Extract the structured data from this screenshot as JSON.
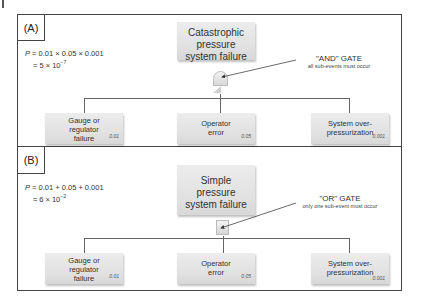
{
  "panels": [
    {
      "label": "(A)",
      "formula": {
        "p": "P",
        "line1": " = 0.01 × 0.05 × 0.001",
        "line2_prefix": "= 5 × 10",
        "line2_exp": "−7"
      },
      "top_event": {
        "line1": "Catastrophic",
        "line2": "pressure",
        "line3": "system failure"
      },
      "gate": {
        "type": "AND",
        "title": "\"AND\" GATE",
        "subtitle": "all sub-events must occur"
      },
      "sub_events": [
        {
          "line1": "Gauge or",
          "line2": "regulator",
          "line3": "failure",
          "probability": "0.01"
        },
        {
          "line1": "Operator",
          "line2": "error",
          "line3": "",
          "probability": "0.05"
        },
        {
          "line1": "System over-",
          "line2": "pressurization",
          "line3": "",
          "probability": "0.001"
        }
      ]
    },
    {
      "label": "(B)",
      "formula": {
        "p": "P",
        "line1": " = 0.01 + 0.05 + 0.001",
        "line2_prefix": "≈ 6 × 10",
        "line2_exp": "−2"
      },
      "top_event": {
        "line1": "Simple",
        "line2": "pressure",
        "line3": "system failure"
      },
      "gate": {
        "type": "OR",
        "title": "\"OR\" GATE",
        "subtitle": "only one sub-event must occur"
      },
      "sub_events": [
        {
          "line1": "Gauge or",
          "line2": "regulator",
          "line3": "failure",
          "probability": "0.01"
        },
        {
          "line1": "Operator",
          "line2": "error",
          "line3": "",
          "probability": "0.05"
        },
        {
          "line1": "System over-",
          "line2": "pressurization",
          "line3": "",
          "probability": "0.001"
        }
      ]
    }
  ]
}
